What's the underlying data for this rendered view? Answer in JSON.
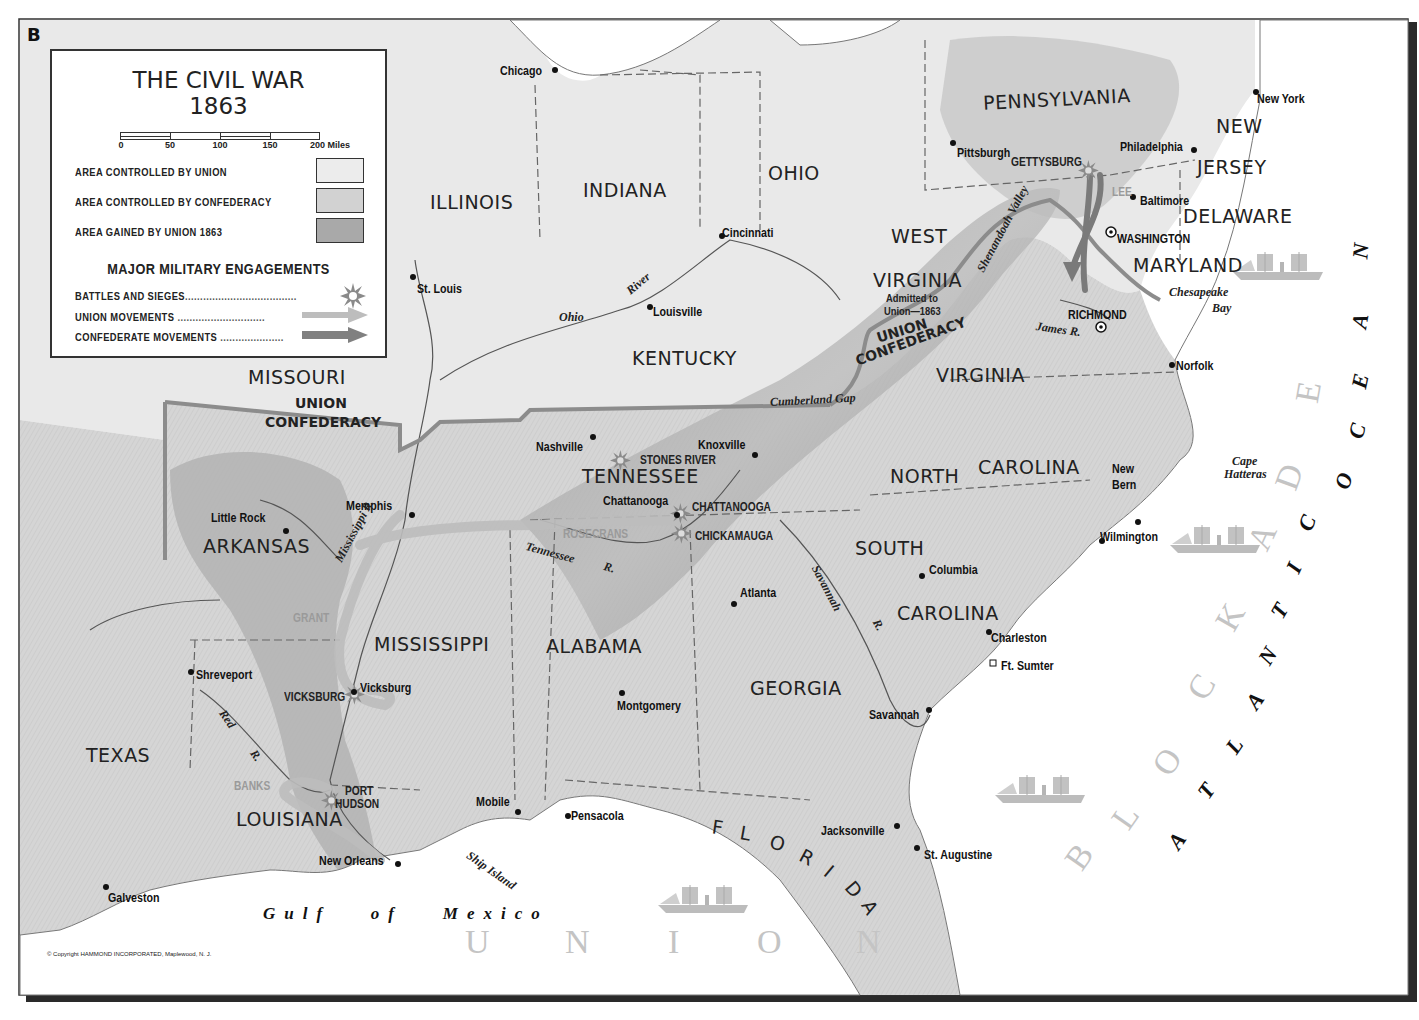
{
  "map": {
    "letter": "B",
    "title_line1": "THE CIVIL WAR",
    "title_line2": "1863",
    "copyright": "© Copyright HAMMOND INCORPORATED, Maplewood, N. J.",
    "colors": {
      "union_area": "#e9e9e9",
      "confederacy_area": "#d6d6d6",
      "gained_area": "#a8a8a8",
      "water": "#ffffff",
      "border": "#333333",
      "union_movement": "#bdbdbd",
      "confederate_movement": "#7a7a7a"
    }
  },
  "legend": {
    "scale": {
      "ticks": [
        "0",
        "50",
        "100",
        "150",
        "200 Miles"
      ]
    },
    "areas": [
      {
        "label": "AREA CONTROLLED BY UNION",
        "swatch": "union"
      },
      {
        "label": "AREA CONTROLLED BY CONFEDERACY",
        "swatch": "confederacy"
      },
      {
        "label": "AREA GAINED BY UNION 1863",
        "swatch": "gained"
      }
    ],
    "engagements_title": "MAJOR MILITARY ENGAGEMENTS",
    "engagements": [
      {
        "label": "BATTLES AND SIEGES",
        "icon": "battle-burst-icon"
      },
      {
        "label": "UNION MOVEMENTS",
        "icon": "union-arrow-icon"
      },
      {
        "label": "CONFEDERATE MOVEMENTS",
        "icon": "confederate-arrow-icon"
      }
    ]
  },
  "states": [
    {
      "name": "PENNSYLVANIA",
      "x": 983,
      "y": 90,
      "rot": -3
    },
    {
      "name": "NEW",
      "x": 1216,
      "y": 117,
      "rot": 0
    },
    {
      "name": "JERSEY",
      "x": 1197,
      "y": 158,
      "rot": 0
    },
    {
      "name": "DELAWARE",
      "x": 1183,
      "y": 207,
      "rot": 0
    },
    {
      "name": "MARYLAND",
      "x": 1133,
      "y": 256,
      "rot": 0
    },
    {
      "name": "OHIO",
      "x": 768,
      "y": 164,
      "rot": 0
    },
    {
      "name": "INDIANA",
      "x": 583,
      "y": 181,
      "rot": 0
    },
    {
      "name": "ILLINOIS",
      "x": 430,
      "y": 193,
      "rot": 0
    },
    {
      "name": "WEST",
      "x": 891,
      "y": 227,
      "rot": 0
    },
    {
      "name": "VIRGINIA",
      "x": 873,
      "y": 271,
      "rot": 0
    },
    {
      "name": "KENTUCKY",
      "x": 632,
      "y": 349,
      "rot": 0
    },
    {
      "name": "MISSOURI",
      "x": 248,
      "y": 368,
      "rot": 0
    },
    {
      "name": "VIRGINIA",
      "x": 936,
      "y": 366,
      "rot": 0
    },
    {
      "name": "TENNESSEE",
      "x": 582,
      "y": 467,
      "rot": 0
    },
    {
      "name": "NORTH",
      "x": 890,
      "y": 467,
      "rot": 0
    },
    {
      "name": "CAROLINA",
      "x": 978,
      "y": 458,
      "rot": 0
    },
    {
      "name": "ARKANSAS",
      "x": 203,
      "y": 537,
      "rot": 0
    },
    {
      "name": "SOUTH",
      "x": 855,
      "y": 539,
      "rot": 0
    },
    {
      "name": "CAROLINA",
      "x": 897,
      "y": 604,
      "rot": 0
    },
    {
      "name": "MISSISSIPPI",
      "x": 374,
      "y": 635,
      "rot": 0
    },
    {
      "name": "ALABAMA",
      "x": 546,
      "y": 637,
      "rot": 0
    },
    {
      "name": "GEORGIA",
      "x": 750,
      "y": 679,
      "rot": 0
    },
    {
      "name": "TEXAS",
      "x": 86,
      "y": 746,
      "rot": 0
    },
    {
      "name": "LOUISIANA",
      "x": 236,
      "y": 810,
      "rot": 0
    }
  ],
  "florida": {
    "letters": [
      "F",
      "L",
      "O",
      "R",
      "I",
      "D",
      "A"
    ]
  },
  "cities": [
    {
      "name": "Chicago",
      "x": 500,
      "y": 64
    },
    {
      "name": "New York",
      "x": 1257,
      "y": 92
    },
    {
      "name": "Pittsburgh",
      "x": 957,
      "y": 146
    },
    {
      "name": "Philadelphia",
      "x": 1120,
      "y": 140
    },
    {
      "name": "Baltimore",
      "x": 1140,
      "y": 194
    },
    {
      "name": "WASHINGTON",
      "x": 1117,
      "y": 232
    },
    {
      "name": "Cincinnati",
      "x": 722,
      "y": 226
    },
    {
      "name": "St. Louis",
      "x": 417,
      "y": 282
    },
    {
      "name": "Louisville",
      "x": 653,
      "y": 305
    },
    {
      "name": "RICHMOND",
      "x": 1068,
      "y": 308
    },
    {
      "name": "Norfolk",
      "x": 1176,
      "y": 359
    },
    {
      "name": "Nashville",
      "x": 536,
      "y": 440
    },
    {
      "name": "Knoxville",
      "x": 698,
      "y": 438
    },
    {
      "name": "New",
      "x": 1112,
      "y": 462
    },
    {
      "name": "Bern",
      "x": 1112,
      "y": 478
    },
    {
      "name": "Memphis",
      "x": 346,
      "y": 499
    },
    {
      "name": "Chattanooga",
      "x": 603,
      "y": 494
    },
    {
      "name": "Little Rock",
      "x": 211,
      "y": 511
    },
    {
      "name": "Wilmington",
      "x": 1100,
      "y": 530
    },
    {
      "name": "Columbia",
      "x": 929,
      "y": 563
    },
    {
      "name": "Atlanta",
      "x": 740,
      "y": 586
    },
    {
      "name": "Charleston",
      "x": 991,
      "y": 631
    },
    {
      "name": "Ft. Sumter",
      "x": 1001,
      "y": 659
    },
    {
      "name": "Shreveport",
      "x": 196,
      "y": 668
    },
    {
      "name": "Vicksburg",
      "x": 360,
      "y": 681
    },
    {
      "name": "Montgomery",
      "x": 617,
      "y": 699
    },
    {
      "name": "Savannah",
      "x": 869,
      "y": 708
    },
    {
      "name": "Mobile",
      "x": 476,
      "y": 795
    },
    {
      "name": "Pensacola",
      "x": 571,
      "y": 809
    },
    {
      "name": "Jacksonville",
      "x": 821,
      "y": 824
    },
    {
      "name": "St. Augustine",
      "x": 924,
      "y": 848
    },
    {
      "name": "New Orleans",
      "x": 319,
      "y": 854
    },
    {
      "name": "Galveston",
      "x": 108,
      "y": 891
    }
  ],
  "battles": [
    {
      "name": "GETTYSBURG",
      "x": 1011,
      "y": 156,
      "bx": 1088,
      "by": 170
    },
    {
      "name": "STONES RIVER",
      "x": 640,
      "y": 454,
      "bx": 620,
      "by": 460
    },
    {
      "name": "CHATTANOOGA",
      "x": 692,
      "y": 501,
      "bx": 680,
      "by": 513
    },
    {
      "name": "CHICKAMAUGA",
      "x": 695,
      "y": 530,
      "bx": 681,
      "by": 533
    },
    {
      "name": "VICKSBURG",
      "x": 284,
      "y": 691,
      "bx": 354,
      "by": 694
    },
    {
      "name": "PORT",
      "x": 345,
      "y": 785,
      "bx": 331,
      "by": 800
    },
    {
      "name": "HUDSON",
      "x": 335,
      "y": 798,
      "bx": null,
      "by": null
    }
  ],
  "generals": [
    {
      "name": "LEE",
      "x": 1112,
      "y": 186
    },
    {
      "name": "ROSECRANS",
      "x": 563,
      "y": 528
    },
    {
      "name": "GRANT",
      "x": 293,
      "y": 612
    },
    {
      "name": "BANKS",
      "x": 234,
      "y": 780
    }
  ],
  "rivers": [
    {
      "name": "Ohio",
      "x": 559,
      "y": 311,
      "rot": 0
    },
    {
      "name": "River",
      "x": 628,
      "y": 286,
      "rot": -40
    },
    {
      "name": "Cumberland Gap",
      "x": 770,
      "y": 396,
      "rot": -3
    },
    {
      "name": "James R.",
      "x": 1036,
      "y": 320,
      "rot": 8
    },
    {
      "name": "Shenandoah Valley",
      "x": 980,
      "y": 265,
      "rot": -62
    },
    {
      "name": "Tennessee",
      "x": 526,
      "y": 540,
      "rot": 15
    },
    {
      "name": "R.",
      "x": 604,
      "y": 560,
      "rot": 15
    },
    {
      "name": "Mississippi R.",
      "x": 338,
      "y": 555,
      "rot": -62
    },
    {
      "name": "Savannah",
      "x": 815,
      "y": 560,
      "rot": 62
    },
    {
      "name": "R.",
      "x": 876,
      "y": 614,
      "rot": 62
    },
    {
      "name": "Red",
      "x": 222,
      "y": 705,
      "rot": 55
    },
    {
      "name": "R.",
      "x": 253,
      "y": 745,
      "rot": 55
    },
    {
      "name": "Ship Island",
      "x": 468,
      "y": 848,
      "rot": 35
    },
    {
      "name": "Chesapeake",
      "x": 1169,
      "y": 286,
      "rot": 0
    },
    {
      "name": "Bay",
      "x": 1212,
      "y": 302,
      "rot": 0
    },
    {
      "name": "Cape",
      "x": 1232,
      "y": 455,
      "rot": 0
    },
    {
      "name": "Hatteras",
      "x": 1224,
      "y": 468,
      "rot": 0
    }
  ],
  "admitted_note": {
    "line1": "Admitted to",
    "line2": "Union—1863",
    "x": 886,
    "y": 293
  },
  "boundary_labels": [
    {
      "name": "UNION",
      "x": 295,
      "y": 396,
      "rot": 0
    },
    {
      "name": "CONFEDERACY",
      "x": 265,
      "y": 415,
      "rot": 0
    },
    {
      "name": "UNION",
      "x": 877,
      "y": 331,
      "rot": -17
    },
    {
      "name": "CONFEDERACY",
      "x": 856,
      "y": 354,
      "rot": -20
    }
  ],
  "water_labels": {
    "gulf": {
      "text": "Gulf   of   Mexico",
      "x": 263,
      "y": 905
    },
    "atlantic": {
      "letters": [
        "A",
        "T",
        "L",
        "A",
        "N",
        "T",
        "I",
        "C",
        "O",
        "C",
        "E",
        "A",
        "N"
      ]
    },
    "blockade": {
      "letters": [
        "B",
        "L",
        "O",
        "C",
        "K",
        "A",
        "D",
        "E"
      ]
    },
    "union_gulf": {
      "letters": [
        "U",
        "N",
        "I",
        "O",
        "N"
      ]
    }
  },
  "ships": [
    {
      "x": 1233,
      "y": 252
    },
    {
      "x": 1170,
      "y": 525
    },
    {
      "x": 995,
      "y": 775
    },
    {
      "x": 658,
      "y": 885
    }
  ]
}
